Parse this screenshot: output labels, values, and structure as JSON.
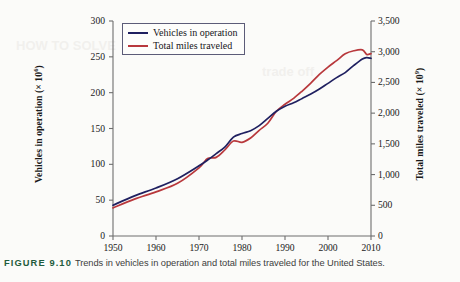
{
  "figure": {
    "caption_label": "FIGURE 9.10",
    "caption_text": "Trends in vehicles in operation and total miles traveled for the United States."
  },
  "axes": {
    "left_title_text": "Vehicles in operation (× 10",
    "left_title_exp": "6",
    "left_title_close": ")",
    "right_title_text": "Total miles traveled (× 10",
    "right_title_exp": "9",
    "right_title_close": ")",
    "left_ticks": [
      "0",
      "50",
      "100",
      "150",
      "200",
      "250",
      "300"
    ],
    "right_ticks": [
      "0",
      "500",
      "1,000",
      "1,500",
      "2,000",
      "2,500",
      "3,000",
      "3,500"
    ],
    "x_ticks": [
      "1950",
      "1960",
      "1970",
      "1980",
      "1990",
      "2000",
      "2010"
    ]
  },
  "legend": {
    "position": "top-left-inside",
    "entries": [
      {
        "label": "Vehicles in operation",
        "color": "#1f2060"
      },
      {
        "label": "Total miles traveled",
        "color": "#b8383c"
      }
    ]
  },
  "colors": {
    "vehicles_line": "#1f2060",
    "miles_line": "#b8383c",
    "axis": "#6e6e6e",
    "caption_label": "#1f5c3d",
    "caption_text": "#3d3d3d",
    "page_background": "#fbfbf9"
  },
  "chart_data": {
    "type": "line",
    "title": "",
    "subtitle": "",
    "xlabel": "",
    "ylabel": "Vehicles in operation (× 10^6)",
    "y2label": "Total miles traveled (× 10^9)",
    "xlim": [
      1950,
      2010
    ],
    "ylim": [
      0,
      300
    ],
    "y2lim": [
      0,
      3500
    ],
    "grid": false,
    "legend_position": "upper left",
    "x": [
      1950,
      1955,
      1960,
      1965,
      1970,
      1972,
      1974,
      1976,
      1978,
      1980,
      1982,
      1984,
      1986,
      1988,
      1990,
      1992,
      1994,
      1996,
      1998,
      2000,
      2002,
      2004,
      2006,
      2008,
      2009,
      2010
    ],
    "series": [
      {
        "name": "Vehicles in operation",
        "units": "millions",
        "axis": "left",
        "color": "#1f2060",
        "values": [
          43,
          56,
          67,
          80,
          98,
          106,
          115,
          124,
          138,
          143,
          147,
          154,
          164,
          174,
          181,
          186,
          192,
          198,
          205,
          213,
          221,
          228,
          238,
          247,
          249,
          248
        ]
      },
      {
        "name": "Total miles traveled",
        "units": "billions of miles",
        "axis": "right",
        "color": "#b8383c",
        "values": [
          458,
          600,
          719,
          858,
          1110,
          1260,
          1280,
          1400,
          1545,
          1525,
          1595,
          1720,
          1835,
          2030,
          2145,
          2240,
          2360,
          2490,
          2630,
          2750,
          2855,
          2965,
          3015,
          3030,
          2955,
          2970
        ]
      }
    ],
    "annotations": [
      {
        "text": "dip in total miles traveled",
        "x": 1974,
        "note": "oil crisis plateau"
      },
      {
        "text": "dip in total miles traveled",
        "x": 1980,
        "note": "second oil shock"
      },
      {
        "text": "curves cross",
        "x": 1991,
        "note": "miles series rises above vehicles series thereafter"
      }
    ]
  }
}
